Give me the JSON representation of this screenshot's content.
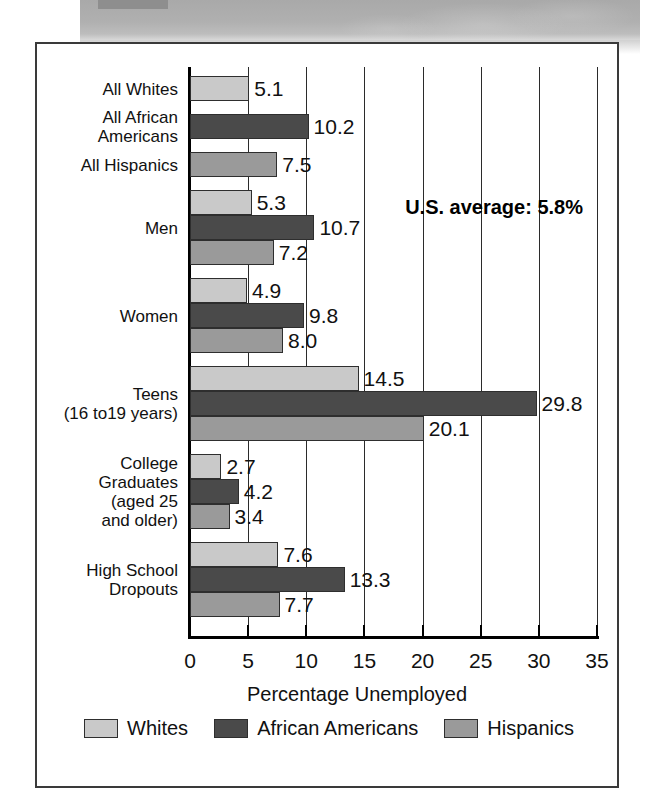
{
  "banner": {
    "label": "scan-banner-strip"
  },
  "chart_data": {
    "type": "bar",
    "orientation": "horizontal",
    "title": "",
    "xlabel": "Percentage Unemployed",
    "ylabel": "",
    "xlim": [
      0,
      35
    ],
    "xticks": [
      "0",
      "5",
      "10",
      "15",
      "20",
      "25",
      "30",
      "35"
    ],
    "grid": "vertical",
    "legend_position": "bottom",
    "categories": [
      "All Whites",
      "All African\nAmericans",
      "All Hispanics",
      "Men",
      "Women",
      "Teens\n(16 to19 years)",
      "College\nGraduates\n(aged 25\nand older)",
      "High School\nDropouts"
    ],
    "groups": [
      {
        "label": "All Whites",
        "label_lines": "All Whites",
        "bars": [
          {
            "series": "Whites",
            "value": 5.1,
            "value_label": "5.1"
          }
        ]
      },
      {
        "label": "All African Americans",
        "label_lines": "All African\nAmericans",
        "bars": [
          {
            "series": "African Americans",
            "value": 10.2,
            "value_label": "10.2"
          }
        ]
      },
      {
        "label": "All Hispanics",
        "label_lines": "All Hispanics",
        "bars": [
          {
            "series": "Hispanics",
            "value": 7.5,
            "value_label": "7.5"
          }
        ]
      },
      {
        "label": "Men",
        "label_lines": "Men",
        "bars": [
          {
            "series": "Whites",
            "value": 5.3,
            "value_label": "5.3"
          },
          {
            "series": "African Americans",
            "value": 10.7,
            "value_label": "10.7"
          },
          {
            "series": "Hispanics",
            "value": 7.2,
            "value_label": "7.2"
          }
        ]
      },
      {
        "label": "Women",
        "label_lines": "Women",
        "bars": [
          {
            "series": "Whites",
            "value": 4.9,
            "value_label": "4.9"
          },
          {
            "series": "African Americans",
            "value": 9.8,
            "value_label": "9.8"
          },
          {
            "series": "Hispanics",
            "value": 8.0,
            "value_label": "8.0"
          }
        ]
      },
      {
        "label": "Teens (16 to 19 years)",
        "label_lines": "Teens\n(16 to19 years)",
        "bars": [
          {
            "series": "Whites",
            "value": 14.5,
            "value_label": "14.5"
          },
          {
            "series": "African Americans",
            "value": 29.8,
            "value_label": "29.8"
          },
          {
            "series": "Hispanics",
            "value": 20.1,
            "value_label": "20.1"
          }
        ]
      },
      {
        "label": "College Graduates (aged 25 and older)",
        "label_lines": "College\nGraduates\n(aged 25\nand older)",
        "bars": [
          {
            "series": "Whites",
            "value": 2.7,
            "value_label": "2.7"
          },
          {
            "series": "African Americans",
            "value": 4.2,
            "value_label": "4.2"
          },
          {
            "series": "Hispanics",
            "value": 3.4,
            "value_label": "3.4"
          }
        ]
      },
      {
        "label": "High School Dropouts",
        "label_lines": "High School\nDropouts",
        "bars": [
          {
            "series": "Whites",
            "value": 7.6,
            "value_label": "7.6"
          },
          {
            "series": "African Americans",
            "value": 13.3,
            "value_label": "13.3"
          },
          {
            "series": "Hispanics",
            "value": 7.7,
            "value_label": "7.7"
          }
        ]
      }
    ],
    "series": [
      {
        "name": "Whites",
        "color": "#c9c9c9",
        "values": [
          5.1,
          null,
          null,
          5.3,
          4.9,
          14.5,
          2.7,
          7.6
        ]
      },
      {
        "name": "African Americans",
        "color": "#4a4a4a",
        "values": [
          null,
          10.2,
          null,
          10.7,
          9.8,
          29.8,
          4.2,
          13.3
        ]
      },
      {
        "name": "Hispanics",
        "color": "#9a9a9a",
        "values": [
          null,
          null,
          7.5,
          7.2,
          8.0,
          20.1,
          3.4,
          7.7
        ]
      }
    ],
    "annotations": [
      {
        "text": "U.S. average: 5.8%",
        "value": 5.8
      }
    ]
  },
  "legend": {
    "items": [
      {
        "label": "Whites",
        "color": "#c9c9c9"
      },
      {
        "label": "African Americans",
        "color": "#4a4a4a"
      },
      {
        "label": "Hispanics",
        "color": "#9a9a9a"
      }
    ]
  }
}
